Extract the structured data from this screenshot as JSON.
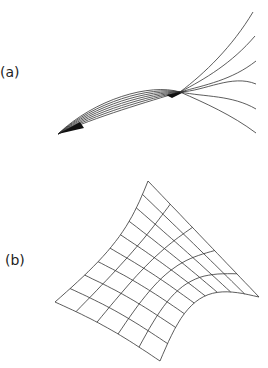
{
  "figure": {
    "panels": [
      {
        "label": "(a)",
        "description": "Family of curves converging through two focal points then fanning out"
      },
      {
        "label": "(b)",
        "description": "Curved quadrilateral grid surface"
      }
    ]
  },
  "panel_a": {
    "lens_curve_count": 7,
    "fan_curve_count": 6
  },
  "panel_b": {
    "grid_rows": 9,
    "grid_cols": 5
  },
  "colors": {
    "stroke": "#333333",
    "background": "#ffffff"
  }
}
